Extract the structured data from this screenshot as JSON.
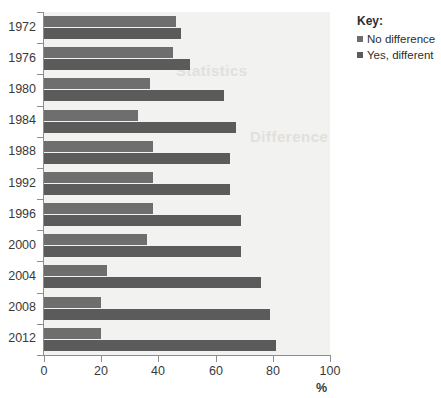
{
  "chart_data": {
    "type": "bar",
    "orientation": "horizontal",
    "title": "",
    "xlabel": "%",
    "ylabel": "",
    "xlim": [
      0,
      100
    ],
    "xticks": [
      0,
      20,
      40,
      60,
      80,
      100
    ],
    "grid": false,
    "categories": [
      "1972",
      "1976",
      "1980",
      "1984",
      "1988",
      "1992",
      "1996",
      "2000",
      "2004",
      "2008",
      "2012"
    ],
    "series": [
      {
        "name": "No difference",
        "color": "#6e6e6e",
        "values": [
          46,
          45,
          37,
          33,
          38,
          38,
          38,
          36,
          22,
          20,
          20
        ]
      },
      {
        "name": "Yes, different",
        "color": "#5b5b5b",
        "values": [
          48,
          51,
          63,
          67,
          65,
          65,
          69,
          69,
          76,
          79,
          81
        ]
      }
    ],
    "legend": {
      "title": "Key:",
      "position": "right"
    }
  },
  "watermarks": [
    {
      "text": "Statistics",
      "x": 176,
      "y": 62
    },
    {
      "text": "Difference",
      "x": 250,
      "y": 128
    }
  ]
}
